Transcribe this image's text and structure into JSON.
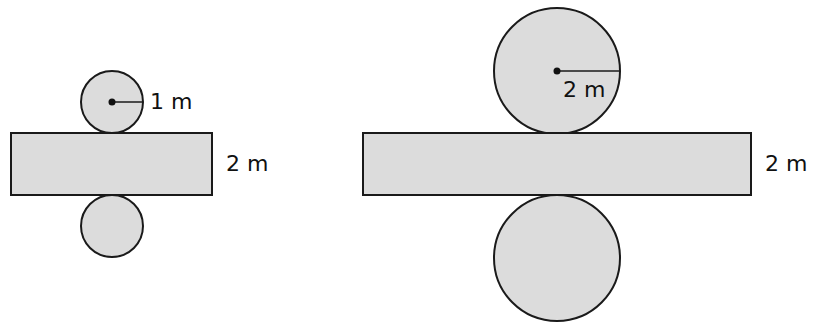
{
  "diagram": {
    "colors": {
      "fill": "#dcdcdc",
      "stroke": "#1a1a1a",
      "background": "#ffffff"
    },
    "left_net": {
      "radius_label": "1 m",
      "height_label": "2 m"
    },
    "right_net": {
      "radius_label": "2 m",
      "height_label": "2 m"
    }
  }
}
